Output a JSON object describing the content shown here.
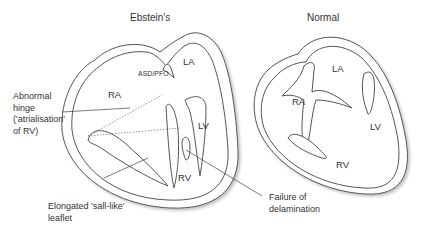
{
  "diagrams": [
    {
      "title": "Ebstein's",
      "chambers": {
        "la": "LA",
        "ra": "RA",
        "lv": "LV",
        "rv": "RV"
      },
      "defect_label": "ASD/PFO"
    },
    {
      "title": "Normal",
      "chambers": {
        "la": "LA",
        "ra": "RA",
        "lv": "LV",
        "rv": "RV"
      }
    }
  ],
  "annotations": {
    "abnormal_hinge": [
      "Abnormal",
      "hinge",
      "('atrialisation'",
      "of RV)"
    ],
    "elongated_leaflet": [
      "Elongated 'sall-like'",
      "leaflet"
    ],
    "failure_delamination": [
      "Failure of",
      "delamination"
    ]
  },
  "colors": {
    "outline": "#555555",
    "fill": "#ffffff",
    "text": "#333333",
    "shadow": "#d8d8d8"
  }
}
